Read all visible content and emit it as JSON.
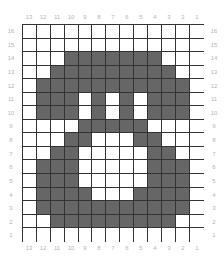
{
  "chart": {
    "columns": [
      "13",
      "12",
      "11",
      "10",
      "9",
      "8",
      "7",
      "6",
      "5",
      "4",
      "3",
      "2",
      "1"
    ],
    "rows": [
      "16",
      "15",
      "14",
      "13",
      "12",
      "11",
      "10",
      "9",
      "8",
      "7",
      "6",
      "5",
      "4",
      "3",
      "2",
      "1"
    ],
    "colors": {
      "filled": "#666666",
      "empty": "#ffffff",
      "gridline": "#333333",
      "label": "#b5b5b5"
    },
    "cells": [
      "0000000000000",
      "0000000000000",
      "0001111111000",
      "0011111111100",
      "0111111111110",
      "0111010101110",
      "0111010101110",
      "0000111110000",
      "0001100011000",
      "0011000001100",
      "0111000001110",
      "0111000001110",
      "0111100011110",
      "0111111111110",
      "0011111111100",
      "0000000000000"
    ]
  }
}
